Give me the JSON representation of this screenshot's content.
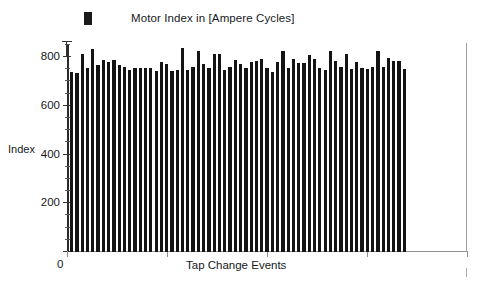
{
  "legend": {
    "marker_name": "legend-swatch",
    "label": "Motor Index in [Ampere Cycles]",
    "color": "#1a1a1a"
  },
  "axes": {
    "ylabel": "Index",
    "xlabel": "Tap Change Events",
    "x_origin_label": "0",
    "y_ticks": [
      "800",
      "600",
      "400",
      "200",
      "0"
    ]
  },
  "chart_data": {
    "type": "bar",
    "title": "",
    "subtitle": "",
    "xlabel": "Tap Change Events",
    "ylabel": "Index",
    "legend": [
      "Motor Index in [Ampere Cycles]"
    ],
    "legend_position": "top-left",
    "grid": false,
    "ylim": [
      0,
      880
    ],
    "yticks": [
      0,
      200,
      400,
      600,
      800
    ],
    "ytick_labels": [
      "0",
      "200",
      "400",
      "600",
      "800"
    ],
    "xticks_labeled": [
      0
    ],
    "xtick_labels": [
      "0"
    ],
    "bar_color": "#141414",
    "series": [
      {
        "name": "Motor Index in [Ampere Cycles]",
        "values": [
          742,
          737,
          815,
          760,
          835,
          770,
          790,
          782,
          793,
          772,
          762,
          752,
          757,
          757,
          758,
          757,
          748,
          782,
          775,
          745,
          752,
          840,
          752,
          762,
          828,
          775,
          760,
          817,
          818,
          752,
          762,
          790,
          775,
          760,
          785,
          788,
          797,
          760,
          743,
          785,
          828,
          760,
          795,
          780,
          778,
          812,
          798,
          760,
          752,
          830,
          787,
          762,
          816,
          753,
          783,
          757,
          755,
          762,
          830,
          762,
          800,
          787,
          787,
          753
        ]
      }
    ]
  }
}
